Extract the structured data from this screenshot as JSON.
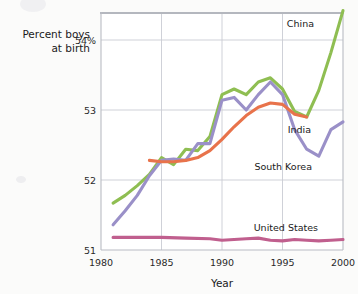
{
  "chart_data": {
    "type": "line",
    "title": "",
    "xlabel": "Year",
    "ylabel": "Percent boys at birth",
    "ylabel_line1": "Percent boys",
    "ylabel_line2": "at birth",
    "xlim": [
      1980,
      2000
    ],
    "ylim": [
      51,
      54.5
    ],
    "grid": true,
    "legend_position": "inline-right",
    "xticks": [
      1980,
      1985,
      1990,
      1995,
      2000
    ],
    "xtick_labels": [
      "1980",
      "1985",
      "1990",
      "1995",
      "2000"
    ],
    "yticks": [
      51,
      52,
      53,
      54
    ],
    "ytick_labels": [
      "51",
      "52",
      "53",
      "54%"
    ],
    "series": [
      {
        "name": "China",
        "color": "#8fbe52",
        "label": "China",
        "x": [
          1981,
          1982,
          1983,
          1984,
          1985,
          1986,
          1987,
          1988,
          1989,
          1990,
          1991,
          1992,
          1993,
          1994,
          1995,
          1996,
          1997,
          1998,
          1999,
          2000
        ],
        "values": [
          51.67,
          51.78,
          51.92,
          52.08,
          52.32,
          52.22,
          52.44,
          52.42,
          52.62,
          53.22,
          53.3,
          53.22,
          53.4,
          53.46,
          53.3,
          52.98,
          52.9,
          53.28,
          53.82,
          54.42
        ]
      },
      {
        "name": "South Korea",
        "color": "#9a90c8",
        "label": "South Korea",
        "x": [
          1981,
          1982,
          1983,
          1984,
          1985,
          1986,
          1987,
          1988,
          1989,
          1990,
          1991,
          1992,
          1993,
          1994,
          1995,
          1996,
          1997,
          1998,
          1999,
          2000
        ],
        "values": [
          51.36,
          51.56,
          51.78,
          52.06,
          52.28,
          52.3,
          52.28,
          52.52,
          52.52,
          53.14,
          53.18,
          53.0,
          53.22,
          53.4,
          53.22,
          52.72,
          52.44,
          52.34,
          52.72,
          52.83
        ]
      },
      {
        "name": "India",
        "color": "#e8734b",
        "label": "India",
        "x": [
          1984,
          1985,
          1986,
          1987,
          1988,
          1989,
          1990,
          1991,
          1992,
          1993,
          1994,
          1995,
          1996,
          1997
        ],
        "values": [
          52.28,
          52.26,
          52.26,
          52.28,
          52.32,
          52.42,
          52.58,
          52.76,
          52.92,
          53.04,
          53.1,
          53.08,
          52.94,
          52.9
        ]
      },
      {
        "name": "United States",
        "color": "#c05f8e",
        "label": "United States",
        "x": [
          1981,
          1983,
          1985,
          1987,
          1989,
          1990,
          1991,
          1992,
          1993,
          1994,
          1995,
          1996,
          1997,
          1998,
          1999,
          2000
        ],
        "values": [
          51.18,
          51.18,
          51.18,
          51.17,
          51.16,
          51.14,
          51.15,
          51.16,
          51.17,
          51.14,
          51.13,
          51.15,
          51.14,
          51.13,
          51.14,
          51.15
        ]
      }
    ],
    "series_labels": [
      {
        "name": "China",
        "text": "China",
        "x": 314,
        "y": 27
      },
      {
        "name": "India",
        "text": "India",
        "x": 311,
        "y": 133
      },
      {
        "name": "South Korea",
        "text": "South Korea",
        "x": 312,
        "y": 170
      },
      {
        "name": "United States",
        "text": "United States",
        "x": 318,
        "y": 231
      }
    ]
  }
}
